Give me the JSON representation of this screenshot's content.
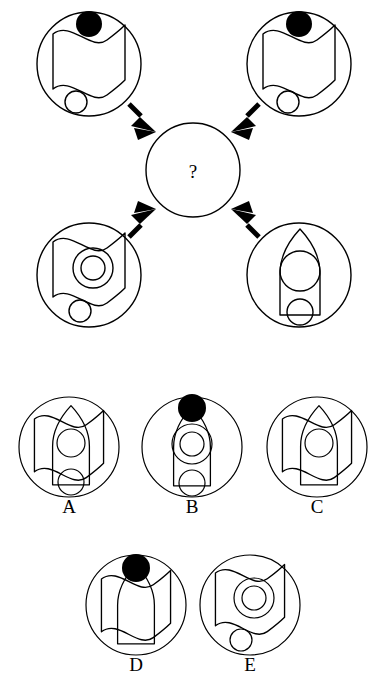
{
  "puzzle": {
    "type": "visual-analogy-matrix",
    "center_symbol": "?",
    "stroke_color": "#000000",
    "fill_dot_color": "#000000",
    "background_color": "#ffffff",
    "matrix": {
      "arrow_count": 4,
      "arrow_direction": "inward-to-center",
      "cells": [
        {
          "id": "top-left",
          "name": "matrix-cell-top-left",
          "cx": 89,
          "cy": 64,
          "r": 52,
          "elements": [
            "black-dot",
            "wavy-flag",
            "small-circle"
          ]
        },
        {
          "id": "top-right",
          "name": "matrix-cell-top-right",
          "cx": 299,
          "cy": 64,
          "r": 52,
          "elements": [
            "black-dot",
            "wavy-flag",
            "small-circle"
          ]
        },
        {
          "id": "bottom-left",
          "name": "matrix-cell-bottom-left",
          "cx": 89,
          "cy": 275,
          "r": 52,
          "elements": [
            "wavy-flag",
            "concentric-circles",
            "small-circle"
          ]
        },
        {
          "id": "bottom-right",
          "name": "matrix-cell-bottom-right",
          "cx": 299,
          "cy": 275,
          "r": 52,
          "elements": [
            "bullet-shape",
            "large-circle",
            "small-circle"
          ]
        }
      ],
      "center": {
        "name": "matrix-center-unknown",
        "cx": 193,
        "cy": 170,
        "r": 47
      }
    },
    "options": [
      {
        "id": "A",
        "label": "A",
        "name": "answer-option-a",
        "cx": 69,
        "cy": 447,
        "r": 50,
        "label_x": 69,
        "label_y": 507,
        "elements": [
          "wavy-flag",
          "bullet-shape",
          "large-circle",
          "small-circle"
        ]
      },
      {
        "id": "B",
        "label": "B",
        "name": "answer-option-b",
        "cx": 192,
        "cy": 447,
        "r": 50,
        "label_x": 192,
        "label_y": 507,
        "elements": [
          "black-dot",
          "bullet-shape",
          "concentric-circles",
          "small-circle"
        ]
      },
      {
        "id": "C",
        "label": "C",
        "name": "answer-option-c",
        "cx": 317,
        "cy": 447,
        "r": 50,
        "label_x": 317,
        "label_y": 507,
        "elements": [
          "wavy-flag",
          "bullet-shape",
          "large-circle"
        ]
      },
      {
        "id": "D",
        "label": "D",
        "name": "answer-option-d",
        "cx": 136,
        "cy": 605,
        "r": 50,
        "label_x": 136,
        "label_y": 665,
        "elements": [
          "black-dot",
          "wavy-flag",
          "bullet-shape"
        ]
      },
      {
        "id": "E",
        "label": "E",
        "name": "answer-option-e",
        "cx": 250,
        "cy": 605,
        "r": 50,
        "label_x": 250,
        "label_y": 665,
        "elements": [
          "wavy-flag",
          "concentric-circles",
          "small-circle"
        ]
      }
    ]
  }
}
